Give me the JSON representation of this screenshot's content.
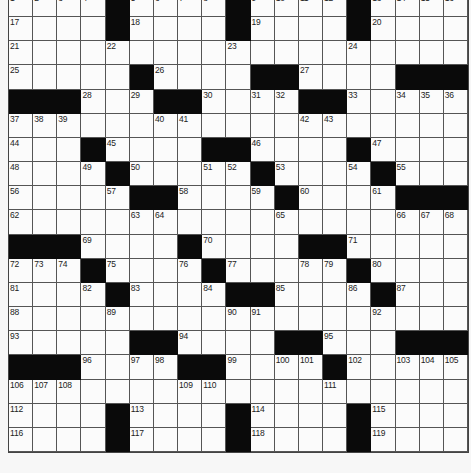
{
  "puzzle": {
    "rows": 19,
    "cols": 19,
    "colors": {
      "black_cell": "#0a0a0a",
      "white_cell": "#fbfbfb",
      "grid_line": "#555555",
      "background": "#f7f7f7"
    },
    "grid": [
      ".... ..... .... ....",
      "XXXX.XXXX.XXXX.XXXX"
    ],
    "layout": [
      "....#....#....#....",
      "....#....#....#....",
      "...................",
      ".....#....##.....###",
      "###...##.....##....",
      "...................",
      "...#....##....#....",
      "....#.....#....#...",
      ".....##....#....###",
      "...................",
      "###....#....##.....",
      "...#...#.#...#.....",
      "....#....##....#...",
      "...................",
      ".....##....##....###",
      "###..##.....#......",
      "...................",
      "....#....#....#....",
      "....#....#....#...."
    ],
    "black_cells": [
      [
        0,
        4
      ],
      [
        0,
        9
      ],
      [
        0,
        14
      ],
      [
        1,
        4
      ],
      [
        1,
        9
      ],
      [
        1,
        14
      ],
      [
        3,
        5
      ],
      [
        3,
        10
      ],
      [
        3,
        11
      ],
      [
        3,
        16
      ],
      [
        3,
        17
      ],
      [
        3,
        18
      ],
      [
        4,
        0
      ],
      [
        4,
        1
      ],
      [
        4,
        2
      ],
      [
        4,
        6
      ],
      [
        4,
        7
      ],
      [
        4,
        12
      ],
      [
        4,
        13
      ],
      [
        6,
        3
      ],
      [
        6,
        8
      ],
      [
        6,
        9
      ],
      [
        6,
        14
      ],
      [
        7,
        4
      ],
      [
        7,
        10
      ],
      [
        7,
        15
      ],
      [
        8,
        5
      ],
      [
        8,
        6
      ],
      [
        8,
        11
      ],
      [
        8,
        16
      ],
      [
        8,
        17
      ],
      [
        8,
        18
      ],
      [
        10,
        0
      ],
      [
        10,
        1
      ],
      [
        10,
        2
      ],
      [
        10,
        7
      ],
      [
        10,
        12
      ],
      [
        10,
        13
      ],
      [
        11,
        3
      ],
      [
        11,
        8
      ],
      [
        11,
        14
      ],
      [
        12,
        4
      ],
      [
        12,
        9
      ],
      [
        12,
        10
      ],
      [
        12,
        15
      ],
      [
        14,
        5
      ],
      [
        14,
        6
      ],
      [
        14,
        11
      ],
      [
        14,
        12
      ],
      [
        14,
        16
      ],
      [
        14,
        17
      ],
      [
        14,
        18
      ],
      [
        15,
        0
      ],
      [
        15,
        1
      ],
      [
        15,
        2
      ],
      [
        15,
        7
      ],
      [
        15,
        8
      ],
      [
        15,
        13
      ],
      [
        17,
        4
      ],
      [
        17,
        9
      ],
      [
        17,
        14
      ],
      [
        18,
        4
      ],
      [
        18,
        9
      ],
      [
        18,
        14
      ]
    ],
    "numbers": [
      {
        "r": 0,
        "c": 0,
        "n": "1"
      },
      {
        "r": 0,
        "c": 1,
        "n": "2"
      },
      {
        "r": 0,
        "c": 2,
        "n": "3"
      },
      {
        "r": 0,
        "c": 3,
        "n": "4"
      },
      {
        "r": 0,
        "c": 5,
        "n": "5"
      },
      {
        "r": 0,
        "c": 6,
        "n": "6"
      },
      {
        "r": 0,
        "c": 7,
        "n": "7"
      },
      {
        "r": 0,
        "c": 8,
        "n": "8"
      },
      {
        "r": 0,
        "c": 10,
        "n": "9"
      },
      {
        "r": 0,
        "c": 11,
        "n": "10"
      },
      {
        "r": 0,
        "c": 12,
        "n": "11"
      },
      {
        "r": 0,
        "c": 13,
        "n": "12"
      },
      {
        "r": 0,
        "c": 15,
        "n": "13"
      },
      {
        "r": 0,
        "c": 16,
        "n": "14"
      },
      {
        "r": 0,
        "c": 17,
        "n": "15"
      },
      {
        "r": 0,
        "c": 18,
        "n": "16"
      },
      {
        "r": 1,
        "c": 0,
        "n": "17"
      },
      {
        "r": 1,
        "c": 5,
        "n": "18"
      },
      {
        "r": 1,
        "c": 10,
        "n": "19"
      },
      {
        "r": 1,
        "c": 15,
        "n": "20"
      },
      {
        "r": 2,
        "c": 0,
        "n": "21"
      },
      {
        "r": 2,
        "c": 4,
        "n": "22"
      },
      {
        "r": 2,
        "c": 9,
        "n": "23"
      },
      {
        "r": 2,
        "c": 14,
        "n": "24"
      },
      {
        "r": 3,
        "c": 0,
        "n": "25"
      },
      {
        "r": 3,
        "c": 6,
        "n": "26"
      },
      {
        "r": 3,
        "c": 12,
        "n": "27"
      },
      {
        "r": 4,
        "c": 3,
        "n": "28"
      },
      {
        "r": 4,
        "c": 5,
        "n": "29"
      },
      {
        "r": 4,
        "c": 8,
        "n": "30"
      },
      {
        "r": 4,
        "c": 10,
        "n": "31"
      },
      {
        "r": 4,
        "c": 11,
        "n": "32"
      },
      {
        "r": 4,
        "c": 14,
        "n": "33"
      },
      {
        "r": 4,
        "c": 16,
        "n": "34"
      },
      {
        "r": 4,
        "c": 17,
        "n": "35"
      },
      {
        "r": 4,
        "c": 18,
        "n": "36"
      },
      {
        "r": 5,
        "c": 0,
        "n": "37"
      },
      {
        "r": 5,
        "c": 1,
        "n": "38"
      },
      {
        "r": 5,
        "c": 2,
        "n": "39"
      },
      {
        "r": 5,
        "c": 6,
        "n": "40"
      },
      {
        "r": 5,
        "c": 7,
        "n": "41"
      },
      {
        "r": 5,
        "c": 12,
        "n": "42"
      },
      {
        "r": 5,
        "c": 13,
        "n": "43"
      },
      {
        "r": 6,
        "c": 0,
        "n": "44"
      },
      {
        "r": 6,
        "c": 4,
        "n": "45"
      },
      {
        "r": 6,
        "c": 10,
        "n": "46"
      },
      {
        "r": 6,
        "c": 15,
        "n": "47"
      },
      {
        "r": 7,
        "c": 0,
        "n": "48"
      },
      {
        "r": 7,
        "c": 3,
        "n": "49"
      },
      {
        "r": 7,
        "c": 5,
        "n": "50"
      },
      {
        "r": 7,
        "c": 8,
        "n": "51"
      },
      {
        "r": 7,
        "c": 9,
        "n": "52"
      },
      {
        "r": 7,
        "c": 11,
        "n": "53"
      },
      {
        "r": 7,
        "c": 14,
        "n": "54"
      },
      {
        "r": 7,
        "c": 16,
        "n": "55"
      },
      {
        "r": 8,
        "c": 0,
        "n": "56"
      },
      {
        "r": 8,
        "c": 4,
        "n": "57"
      },
      {
        "r": 8,
        "c": 7,
        "n": "58"
      },
      {
        "r": 8,
        "c": 10,
        "n": "59"
      },
      {
        "r": 8,
        "c": 12,
        "n": "60"
      },
      {
        "r": 8,
        "c": 15,
        "n": "61"
      },
      {
        "r": 9,
        "c": 0,
        "n": "62"
      },
      {
        "r": 9,
        "c": 5,
        "n": "63"
      },
      {
        "r": 9,
        "c": 6,
        "n": "64"
      },
      {
        "r": 9,
        "c": 11,
        "n": "65"
      },
      {
        "r": 9,
        "c": 16,
        "n": "66"
      },
      {
        "r": 9,
        "c": 17,
        "n": "67"
      },
      {
        "r": 9,
        "c": 18,
        "n": "68"
      },
      {
        "r": 10,
        "c": 3,
        "n": "69"
      },
      {
        "r": 10,
        "c": 8,
        "n": "70"
      },
      {
        "r": 10,
        "c": 14,
        "n": "71"
      },
      {
        "r": 11,
        "c": 0,
        "n": "72"
      },
      {
        "r": 11,
        "c": 1,
        "n": "73"
      },
      {
        "r": 11,
        "c": 2,
        "n": "74"
      },
      {
        "r": 11,
        "c": 4,
        "n": "75"
      },
      {
        "r": 11,
        "c": 7,
        "n": "76"
      },
      {
        "r": 11,
        "c": 9,
        "n": "77"
      },
      {
        "r": 11,
        "c": 12,
        "n": "78"
      },
      {
        "r": 11,
        "c": 13,
        "n": "79"
      },
      {
        "r": 11,
        "c": 15,
        "n": "80"
      },
      {
        "r": 12,
        "c": 0,
        "n": "81"
      },
      {
        "r": 12,
        "c": 3,
        "n": "82"
      },
      {
        "r": 12,
        "c": 5,
        "n": "83"
      },
      {
        "r": 12,
        "c": 8,
        "n": "84"
      },
      {
        "r": 12,
        "c": 11,
        "n": "85"
      },
      {
        "r": 12,
        "c": 14,
        "n": "86"
      },
      {
        "r": 12,
        "c": 16,
        "n": "87"
      },
      {
        "r": 13,
        "c": 0,
        "n": "88"
      },
      {
        "r": 13,
        "c": 4,
        "n": "89"
      },
      {
        "r": 13,
        "c": 9,
        "n": "90"
      },
      {
        "r": 13,
        "c": 10,
        "n": "91"
      },
      {
        "r": 13,
        "c": 15,
        "n": "92"
      },
      {
        "r": 14,
        "c": 0,
        "n": "93"
      },
      {
        "r": 14,
        "c": 7,
        "n": "94"
      },
      {
        "r": 14,
        "c": 13,
        "n": "95"
      },
      {
        "r": 15,
        "c": 3,
        "n": "96"
      },
      {
        "r": 15,
        "c": 5,
        "n": "97"
      },
      {
        "r": 15,
        "c": 6,
        "n": "98"
      },
      {
        "r": 15,
        "c": 9,
        "n": "99"
      },
      {
        "r": 15,
        "c": 11,
        "n": "100"
      },
      {
        "r": 15,
        "c": 12,
        "n": "101"
      },
      {
        "r": 15,
        "c": 14,
        "n": "102"
      },
      {
        "r": 15,
        "c": 16,
        "n": "103"
      },
      {
        "r": 15,
        "c": 17,
        "n": "104"
      },
      {
        "r": 15,
        "c": 18,
        "n": "105"
      },
      {
        "r": 16,
        "c": 0,
        "n": "106"
      },
      {
        "r": 16,
        "c": 1,
        "n": "107"
      },
      {
        "r": 16,
        "c": 2,
        "n": "108"
      },
      {
        "r": 16,
        "c": 7,
        "n": "109"
      },
      {
        "r": 16,
        "c": 8,
        "n": "110"
      },
      {
        "r": 16,
        "c": 13,
        "n": "111"
      },
      {
        "r": 17,
        "c": 0,
        "n": "112"
      },
      {
        "r": 17,
        "c": 5,
        "n": "113"
      },
      {
        "r": 17,
        "c": 10,
        "n": "114"
      },
      {
        "r": 17,
        "c": 15,
        "n": "115"
      },
      {
        "r": 18,
        "c": 0,
        "n": "116"
      },
      {
        "r": 18,
        "c": 5,
        "n": "117"
      },
      {
        "r": 18,
        "c": 10,
        "n": "118"
      },
      {
        "r": 18,
        "c": 15,
        "n": "119"
      }
    ]
  }
}
